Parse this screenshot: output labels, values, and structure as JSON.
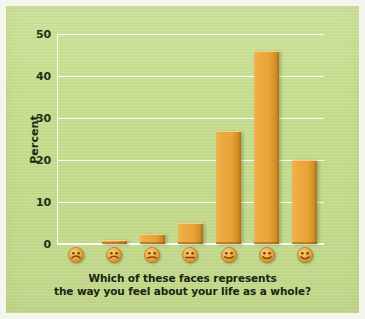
{
  "figure": {
    "panel_color": "#c5dc8c",
    "bar_color": "#e9a338",
    "gridline_color": "#ffffff",
    "text_color": "#1b2412"
  },
  "caption": {
    "line1": "Which of these faces represents",
    "line2": "the way you feel about your life as a whole?"
  },
  "chart_data": {
    "type": "bar",
    "title": "",
    "xlabel": "Which of these faces represents the way you feel about your life as a whole?",
    "ylabel": "Percent",
    "ylim": [
      0,
      50
    ],
    "yticks": [
      0,
      10,
      20,
      30,
      40,
      50
    ],
    "ytick_labels": [
      "0",
      "10",
      "20",
      "30",
      "40",
      "50"
    ],
    "grid": true,
    "legend": "none",
    "categories": [
      "very-unhappy-face",
      "unhappy-face",
      "slightly-unhappy-face",
      "neutral-face",
      "slightly-happy-face",
      "happy-face",
      "very-happy-face"
    ],
    "category_icons": [
      "frowning-face-icon",
      "frowning-face-icon",
      "slightly-frowning-face-icon",
      "neutral-face-icon",
      "slightly-smiling-face-icon",
      "smiling-face-icon",
      "grinning-smiling-face-icon"
    ],
    "values": [
      0,
      1,
      2.5,
      5,
      27,
      46,
      20
    ]
  }
}
